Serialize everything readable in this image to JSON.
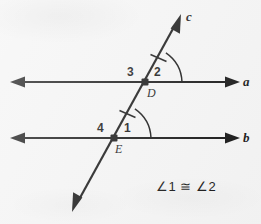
{
  "figure": {
    "kind": "geometry-diagram",
    "background_color": "#f4f4f4",
    "stroke_color": "#111111",
    "line_labels": {
      "a": "a",
      "b": "b",
      "c": "c"
    },
    "point_labels": {
      "D": "D",
      "E": "E"
    },
    "angle_labels": {
      "one": "1",
      "two": "2",
      "three": "3",
      "four": "4"
    },
    "statement": "∠1 ≅ ∠2",
    "geometry": {
      "line_a": {
        "x1": 14,
        "y1": 82,
        "x2": 237,
        "y2": 82,
        "arrows": "both"
      },
      "line_b": {
        "x1": 14,
        "y1": 138,
        "x2": 237,
        "y2": 138,
        "arrows": "both"
      },
      "line_c": {
        "x1": 72,
        "y1": 212,
        "x2": 181,
        "y2": 14,
        "arrows": "both"
      },
      "point_D": {
        "x": 145,
        "y": 82
      },
      "point_E": {
        "x": 114,
        "y": 138
      },
      "tick_upper": {
        "x": 158,
        "y": 58
      },
      "tick_lower": {
        "x": 127,
        "y": 114
      },
      "arc_angle_2": {
        "center_x": 145,
        "center_y": 82,
        "radius": 37
      },
      "arc_angle_1": {
        "center_x": 114,
        "center_y": 138,
        "radius": 37
      }
    }
  }
}
